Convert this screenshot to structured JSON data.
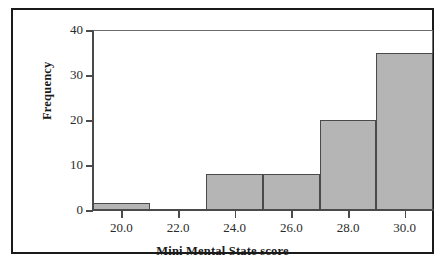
{
  "figure": {
    "bleed_text": "",
    "frame_color": "#1a1a1a",
    "background": "#ffffff"
  },
  "chart_data": {
    "type": "bar",
    "subtype": "histogram",
    "title": "",
    "xlabel": "Mini Mental State score",
    "ylabel": "Frequency",
    "xlim": [
      19,
      31
    ],
    "ylim": [
      0,
      40
    ],
    "grid": false,
    "legend": null,
    "bar_color": "#b5b5b5",
    "bar_edge_color": "#4a4a4a",
    "bin_width": 2,
    "bin_edges": [
      19,
      21,
      23,
      25,
      27,
      29,
      31
    ],
    "categories": [
      "19-21",
      "21-23",
      "23-25",
      "25-27",
      "27-29",
      "29-31"
    ],
    "values": [
      1.5,
      0,
      8,
      8,
      20,
      35
    ],
    "xticks": [
      20,
      22,
      24,
      26,
      28,
      30
    ],
    "xticklabels": [
      "20.0",
      "22.0",
      "24.0",
      "26.0",
      "28.0",
      "30.0"
    ],
    "yticks": [
      0,
      10,
      20,
      30,
      40
    ],
    "yticklabels": [
      "0",
      "10",
      "20",
      "30",
      "40"
    ]
  }
}
